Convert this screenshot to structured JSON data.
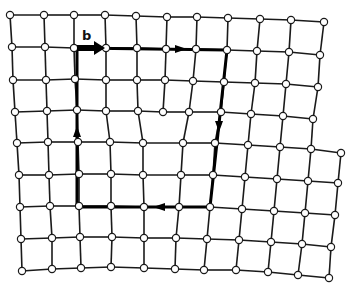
{
  "figure": {
    "burgers_vector_label": "b",
    "colors": {
      "bond": "#1a1a1a",
      "atom_fill": "#ffffff",
      "circuit": "#000000"
    }
  },
  "lattice": {
    "upper_rows": [
      [
        [
          10,
          15
        ],
        [
          44,
          15
        ],
        [
          74,
          15
        ],
        [
          105,
          15
        ],
        [
          136,
          16
        ],
        [
          167,
          17
        ],
        [
          197,
          17
        ],
        [
          228,
          18
        ],
        [
          260,
          19
        ],
        [
          291,
          20
        ],
        [
          324,
          22
        ]
      ],
      [
        [
          12,
          47
        ],
        [
          45,
          47
        ],
        [
          74,
          48
        ],
        [
          106,
          48
        ],
        [
          137,
          48
        ],
        [
          166,
          49
        ],
        [
          196,
          49
        ],
        [
          227,
          50
        ],
        [
          257,
          51
        ],
        [
          289,
          52
        ],
        [
          320,
          55
        ]
      ],
      [
        [
          13,
          80
        ],
        [
          46,
          80
        ],
        [
          75,
          79
        ],
        [
          106,
          80
        ],
        [
          137,
          80
        ],
        [
          165,
          80
        ],
        [
          193,
          81
        ],
        [
          224,
          82
        ],
        [
          255,
          83
        ],
        [
          286,
          84
        ],
        [
          318,
          87
        ]
      ],
      [
        [
          15,
          112
        ],
        [
          47,
          111
        ],
        [
          77,
          110
        ],
        [
          106,
          111
        ],
        [
          138,
          111
        ],
        [
          163,
          112
        ],
        [
          189,
          112
        ],
        [
          221,
          112
        ],
        [
          251,
          114
        ],
        [
          283,
          116
        ],
        [
          313,
          119
        ]
      ]
    ],
    "lower_rows": [
      [
        [
          17,
          143
        ],
        [
          48,
          142
        ],
        [
          78,
          142
        ],
        [
          110,
          142
        ],
        [
          143,
          143
        ],
        [
          183,
          143
        ],
        [
          215,
          143
        ],
        [
          248,
          145
        ],
        [
          280,
          147
        ],
        [
          311,
          149
        ],
        [
          341,
          153
        ]
      ],
      [
        [
          19,
          175
        ],
        [
          49,
          175
        ],
        [
          79,
          174
        ],
        [
          111,
          174
        ],
        [
          143,
          175
        ],
        [
          181,
          175
        ],
        [
          213,
          175
        ],
        [
          245,
          177
        ],
        [
          277,
          179
        ],
        [
          308,
          181
        ],
        [
          338,
          183
        ]
      ],
      [
        [
          20,
          207
        ],
        [
          50,
          206
        ],
        [
          79,
          206
        ],
        [
          111,
          206
        ],
        [
          144,
          207
        ],
        [
          179,
          207
        ],
        [
          210,
          207
        ],
        [
          242,
          209
        ],
        [
          274,
          211
        ],
        [
          305,
          213
        ],
        [
          335,
          215
        ]
      ],
      [
        [
          21,
          239
        ],
        [
          52,
          238
        ],
        [
          80,
          237
        ],
        [
          112,
          237
        ],
        [
          144,
          238
        ],
        [
          176,
          238
        ],
        [
          207,
          239
        ],
        [
          239,
          240
        ],
        [
          271,
          242
        ],
        [
          302,
          244
        ],
        [
          331,
          247
        ]
      ],
      [
        [
          22,
          271
        ],
        [
          52,
          269
        ],
        [
          81,
          268
        ],
        [
          111,
          267
        ],
        [
          144,
          268
        ],
        [
          175,
          269
        ],
        [
          204,
          270
        ],
        [
          236,
          270
        ],
        [
          268,
          272
        ],
        [
          298,
          275
        ],
        [
          329,
          278
        ]
      ]
    ],
    "core_links": [
      [
        [
          15,
          112
        ],
        [
          17,
          143
        ]
      ],
      [
        [
          47,
          111
        ],
        [
          48,
          142
        ]
      ],
      [
        [
          77,
          110
        ],
        [
          78,
          142
        ]
      ],
      [
        [
          106,
          111
        ],
        [
          110,
          142
        ]
      ],
      [
        [
          138,
          111
        ],
        [
          143,
          143
        ]
      ],
      [
        [
          189,
          112
        ],
        [
          183,
          143
        ]
      ],
      [
        [
          221,
          112
        ],
        [
          215,
          143
        ]
      ],
      [
        [
          251,
          114
        ],
        [
          248,
          145
        ]
      ],
      [
        [
          283,
          116
        ],
        [
          280,
          147
        ]
      ],
      [
        [
          313,
          119
        ],
        [
          311,
          149
        ]
      ]
    ]
  },
  "circuit": {
    "path": [
      [
        77,
        207
      ],
      [
        77,
        48
      ],
      [
        227,
        50
      ],
      [
        210,
        207
      ],
      [
        77,
        207
      ]
    ],
    "direction_arrows": [
      {
        "at": [
          77,
          132
        ],
        "dir": "up"
      },
      {
        "at": [
          180,
          49
        ],
        "dir": "right"
      },
      {
        "at": [
          219,
          126
        ],
        "dir": "down"
      },
      {
        "at": [
          160,
          207
        ],
        "dir": "left"
      }
    ],
    "burgers": {
      "from": [
        77,
        48
      ],
      "to": [
        106,
        48
      ],
      "label_pos": [
        82,
        40
      ]
    }
  }
}
